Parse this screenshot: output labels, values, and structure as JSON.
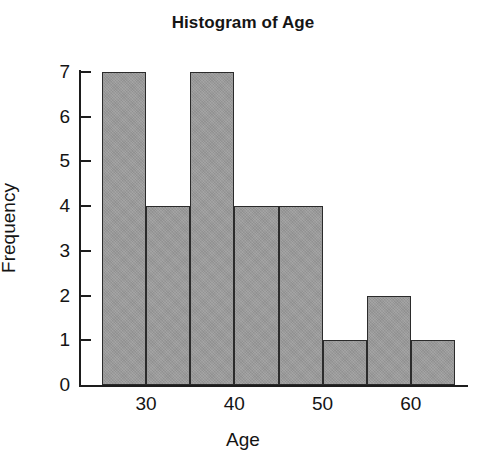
{
  "chart_data": {
    "type": "bar",
    "subtype": "histogram",
    "title": "Histogram of Age",
    "xlabel": "Age",
    "ylabel": "Frequency",
    "categories": [
      "25-30",
      "30-35",
      "35-40",
      "40-45",
      "45-50",
      "50-55",
      "55-60",
      "60-65"
    ],
    "bin_edges": [
      25,
      30,
      35,
      40,
      45,
      50,
      55,
      60,
      65
    ],
    "bin_width": 5,
    "values": [
      7,
      4,
      7,
      4,
      4,
      1,
      2,
      1
    ],
    "xlim": [
      25,
      65
    ],
    "ylim": [
      0,
      7
    ],
    "x_ticks": [
      30,
      40,
      50,
      60
    ],
    "x_tick_labels": [
      "30",
      "40",
      "50",
      "60"
    ],
    "y_ticks": [
      0,
      1,
      2,
      3,
      4,
      5,
      6,
      7
    ],
    "y_tick_labels": [
      "0",
      "1",
      "2",
      "3",
      "4",
      "5",
      "6",
      "7"
    ],
    "grid": false,
    "legend": null,
    "bar_fill_color": "#9b9b9b",
    "bar_edge_color": "#2b2b2b",
    "axis_color": "#1d1d1d",
    "background_color": "#ffffff",
    "total_count": 30
  }
}
